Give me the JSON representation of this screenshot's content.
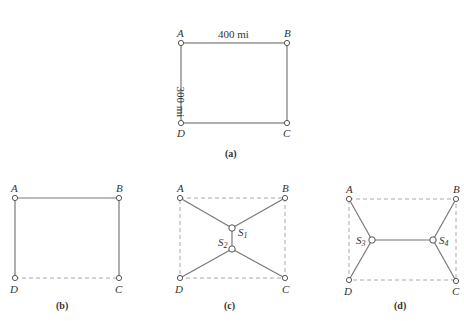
{
  "diagrams": {
    "a": {
      "caption": "(a)",
      "labels": {
        "A": "A",
        "B": "B",
        "C": "C",
        "D": "D"
      },
      "width_label": "400 mi",
      "height_label": "300 mi"
    },
    "b": {
      "caption": "(b)",
      "labels": {
        "A": "A",
        "B": "B",
        "C": "C",
        "D": "D"
      }
    },
    "c": {
      "caption": "(c)",
      "labels": {
        "A": "A",
        "B": "B",
        "C": "C",
        "D": "D",
        "S1": "S",
        "S1_sub": "1",
        "S2": "S",
        "S2_sub": "2"
      }
    },
    "d": {
      "caption": "(d)",
      "labels": {
        "A": "A",
        "B": "B",
        "C": "C",
        "D": "D",
        "S3": "S",
        "S3_sub": "3",
        "S4": "S",
        "S4_sub": "4"
      }
    }
  }
}
